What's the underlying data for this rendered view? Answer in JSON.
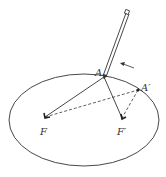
{
  "diagram": {
    "colors": {
      "stroke": "#333333",
      "background": "#ffffff"
    },
    "labels": {
      "point_a": "A",
      "point_a_prime": "A′",
      "focus_f": "F",
      "focus_f_prime": "F′"
    },
    "elements": [
      "ellipse",
      "pencil",
      "string-solid-F-A",
      "string-solid-A-F′",
      "string-dashed-F-A′",
      "string-dashed-A′-F′",
      "motion-arrow"
    ]
  }
}
